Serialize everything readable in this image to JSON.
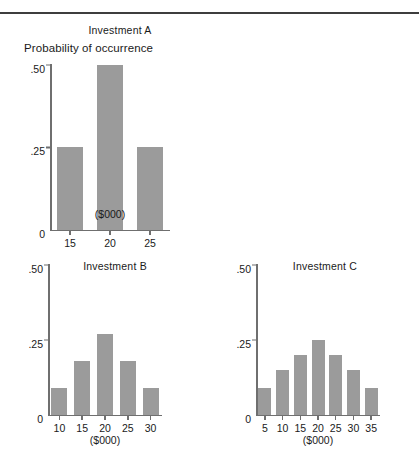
{
  "chart_data": [
    {
      "id": "a",
      "type": "bar",
      "title": "Investment A",
      "ylabel": "Probability of occurrence",
      "xlabel": "($000)",
      "categories": [
        "15",
        "20",
        "25"
      ],
      "values": [
        0.25,
        0.5,
        0.25
      ],
      "yticks": [
        "0",
        ".25",
        ".50"
      ],
      "ytick_values": [
        0,
        0.25,
        0.5
      ],
      "ylim": [
        0,
        0.5
      ],
      "grid": false,
      "legend": "none",
      "bar_color": "#9b9b9b"
    },
    {
      "id": "b",
      "type": "bar",
      "title": "Investment B",
      "ylabel": "",
      "xlabel": "($000)",
      "categories": [
        "10",
        "15",
        "20",
        "25",
        "30"
      ],
      "values": [
        0.09,
        0.18,
        0.27,
        0.18,
        0.09
      ],
      "yticks": [
        "0",
        ".25",
        ".50"
      ],
      "ytick_values": [
        0,
        0.25,
        0.5
      ],
      "ylim": [
        0,
        0.5
      ],
      "grid": false,
      "legend": "none",
      "bar_color": "#9b9b9b"
    },
    {
      "id": "c",
      "type": "bar",
      "title": "Investment C",
      "ylabel": "",
      "xlabel": "($000)",
      "categories": [
        "5",
        "10",
        "15",
        "20",
        "25",
        "30",
        "35"
      ],
      "values": [
        0.09,
        0.15,
        0.2,
        0.25,
        0.2,
        0.15,
        0.09
      ],
      "yticks": [
        "0",
        ".25",
        ".50"
      ],
      "ytick_values": [
        0,
        0.25,
        0.5
      ],
      "ylim": [
        0,
        0.5
      ],
      "grid": false,
      "legend": "none",
      "bar_color": "#9b9b9b"
    }
  ],
  "figure": {
    "rule_color": "#3d3d3d",
    "axis_color": "#6f6f6f",
    "text_color": "#1a1a1a"
  }
}
